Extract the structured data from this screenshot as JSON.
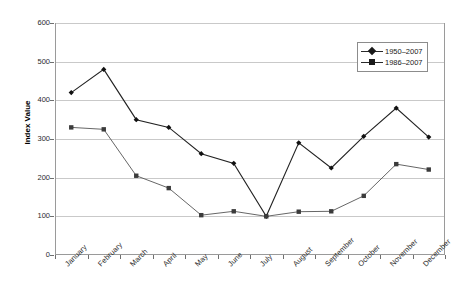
{
  "chart_data": {
    "type": "line",
    "title": "",
    "xlabel": "",
    "ylabel": "Index Value",
    "ylim": [
      0,
      600
    ],
    "ytick_step": 100,
    "yticks": [
      0,
      100,
      200,
      300,
      400,
      500,
      600
    ],
    "grid": true,
    "legend_position": "top-right",
    "categories": [
      "January",
      "February",
      "March",
      "April",
      "May",
      "June",
      "July",
      "August",
      "September",
      "October",
      "November",
      "December"
    ],
    "series": [
      {
        "name": "1950–2007",
        "marker": "diamond",
        "color": "#222222",
        "values": [
          420,
          480,
          350,
          330,
          262,
          237,
          100,
          290,
          225,
          307,
          380,
          305
        ]
      },
      {
        "name": "1986–2007",
        "marker": "square",
        "color": "#555555",
        "values": [
          330,
          325,
          205,
          173,
          103,
          113,
          100,
          112,
          113,
          153,
          235,
          221
        ]
      }
    ]
  },
  "legend": {
    "items": [
      {
        "label": "1950–2007",
        "marker": "diamond"
      },
      {
        "label": "1986–2007",
        "marker": "square"
      }
    ]
  },
  "axes": {
    "y_title": "Index Value",
    "y_labels": [
      "600",
      "500",
      "400",
      "300",
      "200",
      "100",
      "0"
    ]
  }
}
